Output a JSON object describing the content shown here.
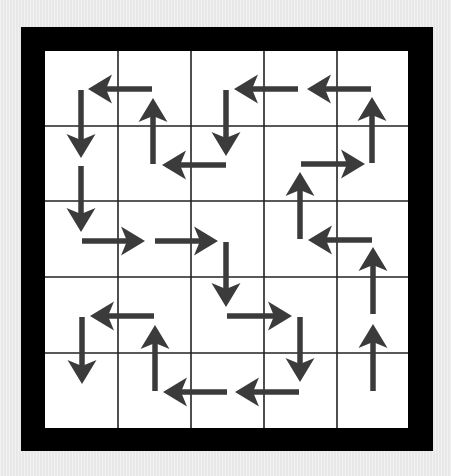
{
  "puzzle": {
    "title": "Arrow path grid",
    "rows": 5,
    "cols": 5,
    "colors": {
      "background": "#ececec",
      "border": "#000000",
      "cell": "#ffffff",
      "gridline": "#222222",
      "arrow": "#3b3b3b"
    },
    "geometry": {
      "outer": {
        "x": 21,
        "y": 27,
        "w": 412,
        "h": 424
      },
      "inner": {
        "x": 45,
        "y": 51,
        "w": 363,
        "h": 377
      },
      "col_lines": [
        45,
        118,
        191,
        264,
        337,
        408
      ],
      "row_lines": [
        51,
        126,
        201,
        277,
        353,
        428
      ]
    },
    "arrows": [
      {
        "id": "a1",
        "dir": "left",
        "from": [
          152,
          89
        ],
        "to": [
          88,
          89
        ]
      },
      {
        "id": "a2",
        "dir": "down",
        "from": [
          81,
          90
        ],
        "to": [
          81,
          158
        ]
      },
      {
        "id": "a3",
        "dir": "up",
        "from": [
          153,
          164
        ],
        "to": [
          153,
          98
        ]
      },
      {
        "id": "a4",
        "dir": "down",
        "from": [
          226,
          90
        ],
        "to": [
          226,
          156
        ]
      },
      {
        "id": "a5",
        "dir": "left",
        "from": [
          226,
          165
        ],
        "to": [
          162,
          165
        ]
      },
      {
        "id": "a6",
        "dir": "left",
        "from": [
          298,
          89
        ],
        "to": [
          234,
          89
        ]
      },
      {
        "id": "a7",
        "dir": "left",
        "from": [
          371,
          89
        ],
        "to": [
          307,
          89
        ]
      },
      {
        "id": "a8",
        "dir": "up",
        "from": [
          372,
          163
        ],
        "to": [
          372,
          97
        ]
      },
      {
        "id": "a9",
        "dir": "right",
        "from": [
          301,
          164
        ],
        "to": [
          365,
          164
        ]
      },
      {
        "id": "a10",
        "dir": "up",
        "from": [
          300,
          239
        ],
        "to": [
          300,
          172
        ]
      },
      {
        "id": "a11",
        "dir": "left",
        "from": [
          372,
          240
        ],
        "to": [
          308,
          240
        ]
      },
      {
        "id": "a12",
        "dir": "up",
        "from": [
          373,
          314
        ],
        "to": [
          373,
          247
        ]
      },
      {
        "id": "a13",
        "dir": "up",
        "from": [
          373,
          391
        ],
        "to": [
          373,
          324
        ]
      },
      {
        "id": "a14",
        "dir": "down",
        "from": [
          81,
          166
        ],
        "to": [
          81,
          232
        ]
      },
      {
        "id": "a15",
        "dir": "right",
        "from": [
          82,
          241
        ],
        "to": [
          145,
          241
        ]
      },
      {
        "id": "a16",
        "dir": "right",
        "from": [
          155,
          241
        ],
        "to": [
          218,
          241
        ]
      },
      {
        "id": "a17",
        "dir": "down",
        "from": [
          226,
          242
        ],
        "to": [
          226,
          307
        ]
      },
      {
        "id": "a18",
        "dir": "right",
        "from": [
          227,
          316
        ],
        "to": [
          292,
          316
        ]
      },
      {
        "id": "a19",
        "dir": "down",
        "from": [
          300,
          317
        ],
        "to": [
          300,
          382
        ]
      },
      {
        "id": "a20",
        "dir": "left",
        "from": [
          299,
          392
        ],
        "to": [
          235,
          392
        ]
      },
      {
        "id": "a21",
        "dir": "left",
        "from": [
          154,
          316
        ],
        "to": [
          90,
          316
        ]
      },
      {
        "id": "a22",
        "dir": "down",
        "from": [
          82,
          317
        ],
        "to": [
          82,
          384
        ]
      },
      {
        "id": "a23",
        "dir": "up",
        "from": [
          155,
          391
        ],
        "to": [
          155,
          325
        ]
      },
      {
        "id": "a24",
        "dir": "left",
        "from": [
          227,
          392
        ],
        "to": [
          163,
          392
        ]
      }
    ]
  }
}
